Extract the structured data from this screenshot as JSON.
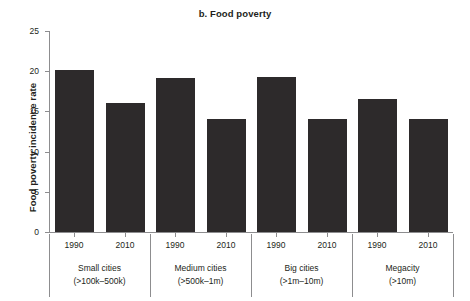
{
  "chart_data": {
    "type": "bar",
    "title": "b. Food poverty",
    "xlabel": "",
    "ylabel": "Food poverty incidence rate",
    "ylim": [
      0,
      25
    ],
    "yticks": [
      0,
      5,
      10,
      15,
      20,
      25
    ],
    "ytick_labels": [
      "0",
      "5",
      "10",
      "15",
      "20",
      "25"
    ],
    "grid": false,
    "legend": "none",
    "categories": [
      "Small cities (>100k–500k)",
      "Medium cities (>500k–1m)",
      "Big cities (>1m–10m)",
      "Megacity (>10m)"
    ],
    "series": [
      {
        "name": "1990",
        "values": [
          20.1,
          19.1,
          19.3,
          16.6
        ]
      },
      {
        "name": "2010",
        "values": [
          16.1,
          14.0,
          14.0,
          14.0
        ]
      }
    ],
    "bar_color": "#2d2a2b",
    "axis_color": "#8d8d8f",
    "text_color": "#231f20",
    "groups": [
      {
        "name_line1": "Small cities",
        "name_line2": "(>100k–500k)",
        "bars": [
          {
            "year": "1990",
            "value": 20.1
          },
          {
            "year": "2010",
            "value": 16.1
          }
        ]
      },
      {
        "name_line1": "Medium cities",
        "name_line2": "(>500k–1m)",
        "bars": [
          {
            "year": "1990",
            "value": 19.1
          },
          {
            "year": "2010",
            "value": 14.0
          }
        ]
      },
      {
        "name_line1": "Big cities",
        "name_line2": "(>1m–10m)",
        "bars": [
          {
            "year": "1990",
            "value": 19.3
          },
          {
            "year": "2010",
            "value": 14.0
          }
        ]
      },
      {
        "name_line1": "Megacity",
        "name_line2": "(>10m)",
        "bars": [
          {
            "year": "1990",
            "value": 16.6
          },
          {
            "year": "2010",
            "value": 14.0
          }
        ]
      }
    ]
  }
}
